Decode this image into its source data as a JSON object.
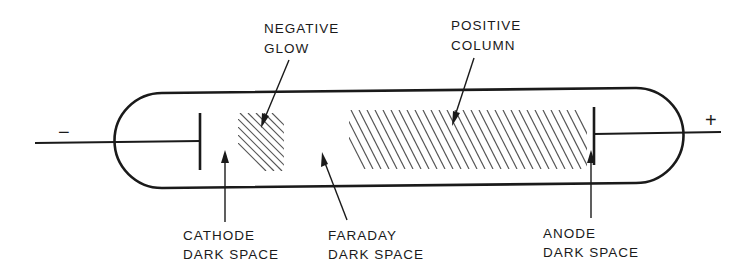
{
  "diagram": {
    "terminals": {
      "cathode_sign": "−",
      "anode_sign": "+"
    },
    "labels": {
      "negative_glow": {
        "line1": "NEGATIVE",
        "line2": "GLOW"
      },
      "positive_column": {
        "line1": "POSITIVE",
        "line2": "COLUMN"
      },
      "cathode_dark_space": {
        "line1": "CATHODE",
        "line2": "DARK SPACE"
      },
      "faraday_dark_space": {
        "line1": "FARADAY",
        "line2": "DARK SPACE"
      },
      "anode_dark_space": {
        "line1": "ANODE",
        "line2": "DARK SPACE"
      }
    },
    "regions": [
      {
        "name": "Cathode",
        "type": "electrode"
      },
      {
        "name": "Cathode Dark Space",
        "type": "dark"
      },
      {
        "name": "Negative Glow",
        "type": "glow"
      },
      {
        "name": "Faraday Dark Space",
        "type": "dark"
      },
      {
        "name": "Positive Column",
        "type": "glow"
      },
      {
        "name": "Anode Dark Space",
        "type": "dark"
      },
      {
        "name": "Anode",
        "type": "electrode"
      }
    ],
    "colors": {
      "ink": "#1a1a1a",
      "hatch": "#555555",
      "background": "#ffffff"
    }
  }
}
